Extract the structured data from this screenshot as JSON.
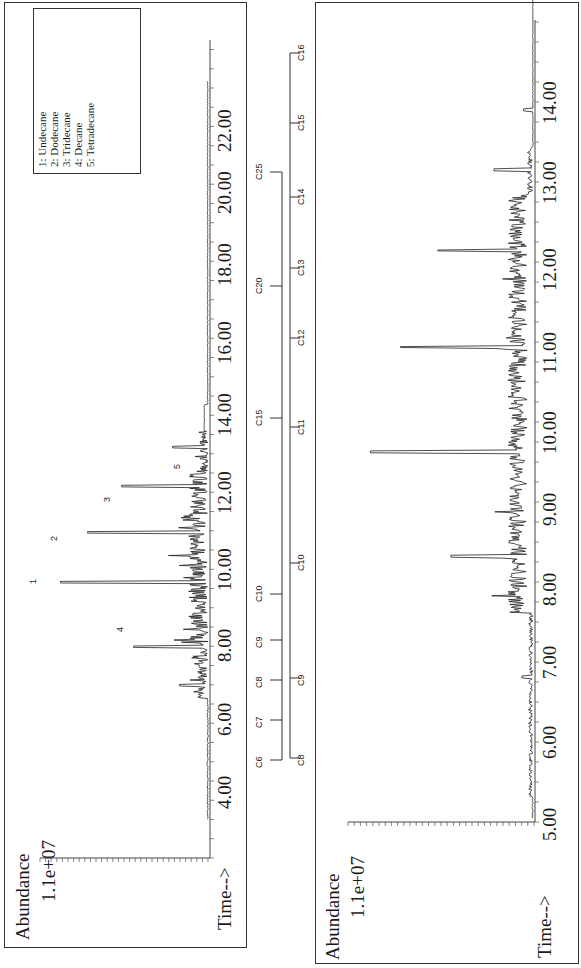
{
  "chart_data": [
    {
      "type": "line",
      "title": "Upper chromatogram (full run)",
      "ylabel": "Abundance",
      "y_max_label": "1.1e+07",
      "xlabel": "Time-->",
      "x_ticks": [
        "4.00",
        "6.00",
        "8.00",
        "10.00",
        "12.00",
        "14.00",
        "16.00",
        "18.00",
        "20.00",
        "22.00"
      ],
      "xlim": [
        3.0,
        24.0
      ],
      "legend": [
        {
          "id": "1",
          "name": "Undecane"
        },
        {
          "id": "2",
          "name": "Dodecane"
        },
        {
          "id": "3",
          "name": "Tridecane"
        },
        {
          "id": "4",
          "name": "Decane"
        },
        {
          "id": "5",
          "name": "Tetradecane"
        }
      ],
      "annotated_peaks": [
        {
          "label": "4",
          "time": 7.9,
          "rel_height": 0.45
        },
        {
          "label": "1",
          "time": 9.6,
          "rel_height": 0.88
        },
        {
          "label": "2",
          "time": 10.9,
          "rel_height": 0.72
        },
        {
          "label": "3",
          "time": 12.1,
          "rel_height": 0.52
        },
        {
          "label": "5",
          "time": 13.1,
          "rel_height": 0.22
        }
      ],
      "carbon_scale": {
        "labels": [
          "C6",
          "C7",
          "C8",
          "C9",
          "C10",
          "C15",
          "C20",
          "C25"
        ],
        "times": [
          3.2,
          4.0,
          5.2,
          6.4,
          7.8,
          13.6,
          17.6,
          21.0
        ]
      }
    },
    {
      "type": "line",
      "title": "Lower chromatogram (expanded 5-15 min)",
      "ylabel": "Abundance",
      "y_max_label": "1.1e+07",
      "xlabel": "Time-->",
      "x_ticks": [
        "5.00",
        "6.00",
        "7.00",
        "8.00",
        "9.00",
        "10.00",
        "11.00",
        "12.00",
        "13.00",
        "14.00"
      ],
      "xlim": [
        5.0,
        15.0
      ],
      "major_peaks": [
        {
          "time": 6.8,
          "rel_height": 0.07
        },
        {
          "time": 8.3,
          "rel_height": 0.45
        },
        {
          "time": 9.6,
          "rel_height": 0.88
        },
        {
          "time": 10.9,
          "rel_height": 0.72
        },
        {
          "time": 12.1,
          "rel_height": 0.52
        },
        {
          "time": 13.1,
          "rel_height": 0.22
        }
      ],
      "carbon_scale": {
        "labels": [
          "C8",
          "C9",
          "C10",
          "C11",
          "C12",
          "C13",
          "C14",
          "C15",
          "C16"
        ],
        "times": [
          5.2,
          7.0,
          8.4,
          9.9,
          11.0,
          12.0,
          13.1,
          14.0,
          15.0
        ]
      }
    }
  ],
  "upper": {
    "ylabel": "Abundance",
    "ymax": "1.1e+07",
    "xlabel": "Time-->",
    "ticks": [
      {
        "label": "4.00",
        "y": 790
      },
      {
        "label": "6.00",
        "y": 717
      },
      {
        "label": "8.00",
        "y": 643
      },
      {
        "label": "10.00",
        "y": 567
      },
      {
        "label": "12.00",
        "y": 490
      },
      {
        "label": "14.00",
        "y": 412
      },
      {
        "label": "16.00",
        "y": 340
      },
      {
        "label": "18.00",
        "y": 262
      },
      {
        "label": "20.00",
        "y": 190
      },
      {
        "label": "22.00",
        "y": 128
      }
    ],
    "legend": [
      "1:  Undecane",
      "2:  Dodecane",
      "3:  Tridecane",
      "4:  Decane",
      "5:  Tetradecane"
    ],
    "peak_labels": [
      {
        "label": "4",
        "x": 115,
        "y": 628
      },
      {
        "label": "1",
        "x": 28,
        "y": 580
      },
      {
        "label": "2",
        "x": 49,
        "y": 537
      },
      {
        "label": "3",
        "x": 102,
        "y": 498
      },
      {
        "label": "5",
        "x": 172,
        "y": 465
      }
    ],
    "carbon": [
      {
        "label": "C6",
        "y": 760
      },
      {
        "label": "C7",
        "y": 720
      },
      {
        "label": "C8",
        "y": 680
      },
      {
        "label": "C9",
        "y": 640
      },
      {
        "label": "C10",
        "y": 594
      },
      {
        "label": "C15",
        "y": 418
      },
      {
        "label": "C20",
        "y": 286
      },
      {
        "label": "C25",
        "y": 172
      }
    ]
  },
  "lower": {
    "ylabel": "Abundance",
    "ymax": "1.1e+07",
    "xlabel": "Time-->",
    "ticks": [
      {
        "label": "5.00",
        "y": 822
      },
      {
        "label": "6.00",
        "y": 740
      },
      {
        "label": "7.00",
        "y": 660
      },
      {
        "label": "8.00",
        "y": 587
      },
      {
        "label": "9.00",
        "y": 507
      },
      {
        "label": "10.00",
        "y": 430
      },
      {
        "label": "11.00",
        "y": 350
      },
      {
        "label": "12.00",
        "y": 267
      },
      {
        "label": "13.00",
        "y": 180
      },
      {
        "label": "14.00",
        "y": 100
      }
    ],
    "carbon": [
      {
        "label": "C8",
        "y": 758
      },
      {
        "label": "C9",
        "y": 678
      },
      {
        "label": "C10",
        "y": 563
      },
      {
        "label": "C11",
        "y": 427
      },
      {
        "label": "C12",
        "y": 338
      },
      {
        "label": "C13",
        "y": 268
      },
      {
        "label": "C14",
        "y": 197
      },
      {
        "label": "C15",
        "y": 123
      },
      {
        "label": "C16",
        "y": 53
      }
    ]
  }
}
